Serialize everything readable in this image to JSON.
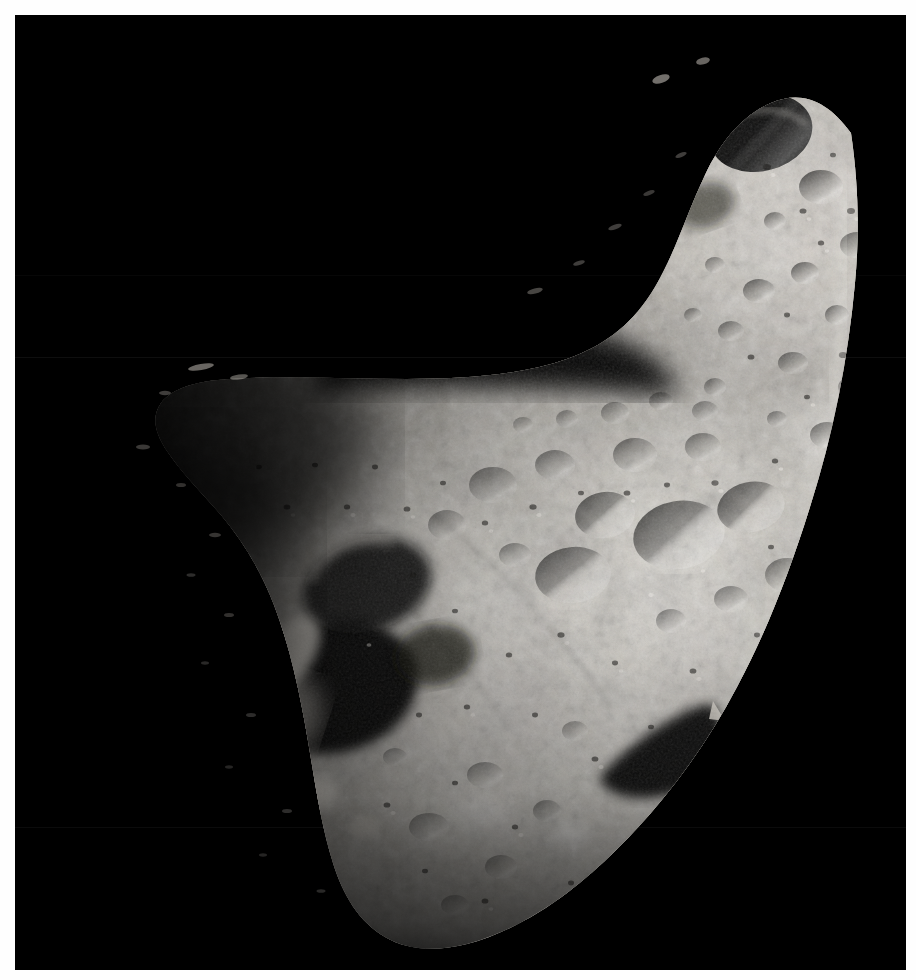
{
  "image": {
    "kind": "photograph",
    "subject": "asteroid",
    "subject_name": "Eros",
    "view": "grayscale spacecraft image of a cratered asteroid against black space",
    "border_color": "#fefefe",
    "space_color": "#000000",
    "regolith_bright": "#e8e6e2",
    "regolith_mid": "#9a968f",
    "regolith_dark": "#3a3833",
    "shadow_color": "#050505",
    "terminator_note": "left and upper-left side fades into shadow",
    "lighting": "sunlit from the right, terminator on the left",
    "frame": {
      "width_px": 916,
      "height_px": 980,
      "plate_left_px": 15,
      "plate_top_px": 15,
      "plate_width_px": 891,
      "plate_height_px": 955
    },
    "features": [
      {
        "name": "north-lobe-rim-crater",
        "description": "dark shadowed crater on the upper lobe rim"
      },
      {
        "name": "saddle-notch",
        "description": "concave saddle separating the upper lobe from the main body"
      },
      {
        "name": "large-shadowed-crater-west",
        "description": "large deeply shadowed crater on the lower-left limb"
      },
      {
        "name": "bright-crater-rim-west",
        "description": "brightly lit crater rim on the lower-left"
      },
      {
        "name": "central-crater-chain",
        "description": "chain of mid-size craters across the middle of the body"
      },
      {
        "name": "waist-shadow-notch",
        "description": "deep shadow wedge on the right waist of the body"
      },
      {
        "name": "sunlit-limb-east",
        "description": "bright sunlit limb along the right edge"
      }
    ]
  }
}
